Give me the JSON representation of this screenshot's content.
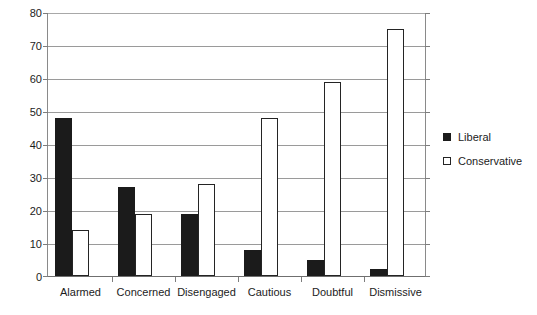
{
  "chart_data": {
    "type": "bar",
    "title": "",
    "xlabel": "",
    "ylabel": "",
    "ylim": [
      0,
      80
    ],
    "ytick_step": 10,
    "yticks": [
      80,
      70,
      60,
      50,
      40,
      30,
      20,
      10,
      0
    ],
    "grid": true,
    "legend_position": "right",
    "categories": [
      "Alarmed",
      "Concerned",
      "Disengaged",
      "Cautious",
      "Doubtful",
      "Dismissive"
    ],
    "series": [
      {
        "name": "Liberal",
        "color": "#1b1b1b",
        "style": "filled",
        "values": [
          48,
          27,
          19,
          8,
          5,
          2
        ]
      },
      {
        "name": "Conservative",
        "color": "#ffffff",
        "style": "hollow",
        "values": [
          14,
          19,
          28,
          48,
          59,
          75
        ]
      }
    ]
  },
  "legend": {
    "items": [
      {
        "label": "Liberal",
        "swatch": "filled-square-icon"
      },
      {
        "label": "Conservative",
        "swatch": "hollow-square-icon"
      }
    ]
  }
}
